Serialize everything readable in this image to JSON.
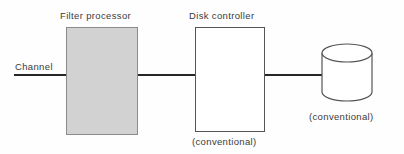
{
  "diagram": {
    "background_color": "#fefefe",
    "line_color": "#262626",
    "nodes": {
      "channel": {
        "label": "Channel",
        "type": "connection-line"
      },
      "filter_processor": {
        "label": "Filter processor",
        "type": "rectangle",
        "fill_color": "#d2d2d2",
        "border_color": "#8b8b8b"
      },
      "disk_controller": {
        "label": "Disk controller",
        "note": "(conventional)",
        "type": "rectangle",
        "fill_color": "#ffffff",
        "border_color": "#555555"
      },
      "disk": {
        "note": "(conventional)",
        "type": "cylinder",
        "fill_color": "#ffffff",
        "border_color": "#555555"
      }
    },
    "connections": [
      {
        "from": "channel",
        "to": "filter_processor"
      },
      {
        "from": "filter_processor",
        "to": "disk_controller"
      },
      {
        "from": "disk_controller",
        "to": "disk"
      }
    ]
  }
}
